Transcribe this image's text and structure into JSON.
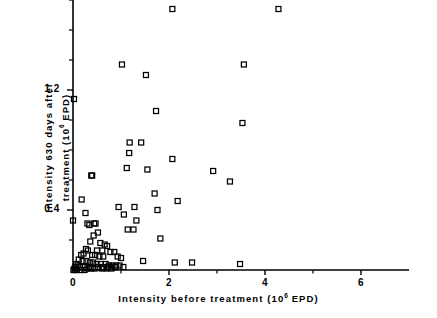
{
  "chart_data": {
    "type": "scatter",
    "title": "",
    "xlabel": "Intensity before treatment (10^6 EPD)",
    "ylabel": "Intensity 630 days after treatment (10^6 EPD)",
    "xlabel_parts": {
      "pre": "Intensity before treatment (10",
      "sup": "6",
      "post": " EPD)"
    },
    "ylabel_line1": "Intensity 630 days after",
    "ylabel_line2_pre": "treatment (10",
    "ylabel_line2_sup": "6",
    "ylabel_line2_post": " EPD)",
    "xlim": [
      0,
      7.0
    ],
    "ylim": [
      0,
      2.95
    ],
    "xticks_major": [
      0,
      2,
      4,
      6
    ],
    "xtick_labels": [
      "0",
      "2",
      "4",
      "6"
    ],
    "xticks_minor": [
      1,
      3,
      5
    ],
    "yticks_major": [
      0.4,
      1.2,
      2.0,
      2.8
    ],
    "ytick_labels": [
      "0.4",
      "1.2",
      "2.0",
      "2.8"
    ],
    "yticks_minor": [
      0.2,
      0.6,
      0.8,
      1.0,
      1.4,
      1.6,
      1.8,
      2.2,
      2.4,
      2.6
    ],
    "ytick_zero_label": "0",
    "grid": false,
    "legend": false,
    "marker": "open-square",
    "marker_size_px": 5,
    "series_name": "patients",
    "points": [
      [
        6.3,
        2.78
      ],
      [
        0.22,
        2.53
      ],
      [
        4.28,
        1.74
      ],
      [
        2.07,
        1.74
      ],
      [
        3.56,
        1.37
      ],
      [
        1.02,
        1.37
      ],
      [
        1.52,
        1.3
      ],
      [
        0.02,
        1.14
      ],
      [
        1.73,
        1.06
      ],
      [
        3.53,
        0.98
      ],
      [
        1.18,
        0.85
      ],
      [
        1.42,
        0.85
      ],
      [
        1.17,
        0.78
      ],
      [
        2.07,
        0.74
      ],
      [
        1.12,
        0.68
      ],
      [
        1.55,
        0.67
      ],
      [
        2.92,
        0.66
      ],
      [
        0.38,
        0.63
      ],
      [
        0.4,
        0.63
      ],
      [
        3.27,
        0.59
      ],
      [
        1.7,
        0.51
      ],
      [
        2.18,
        0.46
      ],
      [
        0.18,
        0.47
      ],
      [
        0.95,
        0.42
      ],
      [
        1.28,
        0.42
      ],
      [
        1.76,
        0.4
      ],
      [
        0.26,
        0.38
      ],
      [
        0.0,
        0.33
      ],
      [
        1.06,
        0.37
      ],
      [
        1.32,
        0.33
      ],
      [
        0.3,
        0.31
      ],
      [
        0.34,
        0.3
      ],
      [
        0.44,
        0.31
      ],
      [
        0.47,
        0.31
      ],
      [
        1.14,
        0.27
      ],
      [
        1.26,
        0.27
      ],
      [
        0.52,
        0.25
      ],
      [
        0.43,
        0.23
      ],
      [
        1.82,
        0.21
      ],
      [
        0.36,
        0.19
      ],
      [
        0.57,
        0.18
      ],
      [
        0.66,
        0.17
      ],
      [
        0.71,
        0.16
      ],
      [
        0.27,
        0.14
      ],
      [
        0.31,
        0.13
      ],
      [
        0.5,
        0.13
      ],
      [
        0.61,
        0.13
      ],
      [
        0.78,
        0.12
      ],
      [
        0.86,
        0.12
      ],
      [
        0.22,
        0.11
      ],
      [
        0.17,
        0.1
      ],
      [
        0.4,
        0.1
      ],
      [
        0.46,
        0.1
      ],
      [
        0.55,
        0.09
      ],
      [
        0.63,
        0.09
      ],
      [
        0.93,
        0.09
      ],
      [
        1.0,
        0.08
      ],
      [
        1.46,
        0.06
      ],
      [
        2.12,
        0.05
      ],
      [
        2.48,
        0.05
      ],
      [
        3.48,
        0.04
      ],
      [
        0.12,
        0.07
      ],
      [
        0.2,
        0.06
      ],
      [
        0.28,
        0.06
      ],
      [
        0.35,
        0.05
      ],
      [
        0.42,
        0.05
      ],
      [
        0.49,
        0.04
      ],
      [
        0.58,
        0.04
      ],
      [
        0.68,
        0.04
      ],
      [
        0.75,
        0.03
      ],
      [
        0.82,
        0.03
      ],
      [
        0.9,
        0.03
      ],
      [
        0.97,
        0.03
      ],
      [
        1.05,
        0.02
      ],
      [
        0.07,
        0.04
      ],
      [
        0.1,
        0.03
      ],
      [
        0.14,
        0.02
      ],
      [
        0.05,
        0.02
      ],
      [
        0.03,
        0.01
      ],
      [
        0.25,
        0.02
      ],
      [
        0.33,
        0.02
      ],
      [
        0.52,
        0.02
      ],
      [
        0.64,
        0.02
      ],
      [
        0.73,
        0.02
      ],
      [
        0.88,
        0.02
      ],
      [
        0.01,
        0.0
      ],
      [
        0.04,
        0.0
      ],
      [
        0.08,
        0.0
      ],
      [
        0.16,
        0.0
      ],
      [
        0.24,
        0.0
      ],
      [
        0.3,
        0.01
      ],
      [
        0.38,
        0.01
      ],
      [
        0.45,
        0.01
      ],
      [
        0.6,
        0.01
      ],
      [
        0.7,
        0.01
      ],
      [
        0.8,
        0.01
      ]
    ]
  },
  "axes": {
    "line_color": "#000000",
    "marker_color": "#000000",
    "background": "#ffffff"
  }
}
